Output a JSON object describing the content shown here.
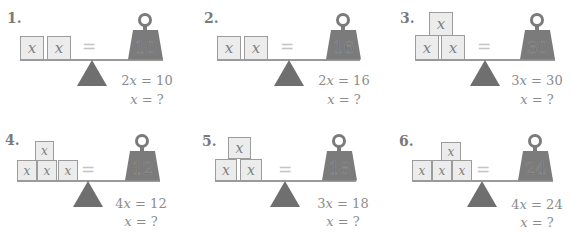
{
  "problems": [
    {
      "number": "1.",
      "left_blocks": [
        "x",
        "x"
      ],
      "equals_sign": "=",
      "weight_value": "10",
      "equation": "2x = 10",
      "question": "x = ?"
    },
    {
      "number": "2.",
      "left_blocks": [
        "x",
        "x"
      ],
      "equals_sign": "=",
      "weight_value": "16",
      "equation": "2x = 16",
      "question": "x = ?"
    },
    {
      "number": "3.",
      "left_blocks": [
        "x",
        "x",
        "x"
      ],
      "equals_sign": "=",
      "weight_value": "30",
      "equation": "3x = 30",
      "question": "x = ?"
    },
    {
      "number": "4.",
      "left_blocks": [
        "x",
        "x",
        "x",
        "x"
      ],
      "equals_sign": "=",
      "weight_value": "12",
      "equation": "4x = 12",
      "question": "x = ?"
    },
    {
      "number": "5.",
      "left_blocks": [
        "x",
        "x",
        "x"
      ],
      "equals_sign": "=",
      "weight_value": "18",
      "equation": "3x = 18",
      "question": "x = ?"
    },
    {
      "number": "6.",
      "left_blocks": [
        "x",
        "x",
        "x",
        "x"
      ],
      "equals_sign": "=",
      "weight_value": "24",
      "equation": "4x = 24",
      "question": "x = ?"
    }
  ],
  "colors": {
    "block_fill": "#ececec",
    "block_border": "#9c9c9c",
    "weight_fill": "#7b7b7b",
    "fulcrum_fill": "#6f6f6f",
    "text": "#8c8c8c"
  }
}
